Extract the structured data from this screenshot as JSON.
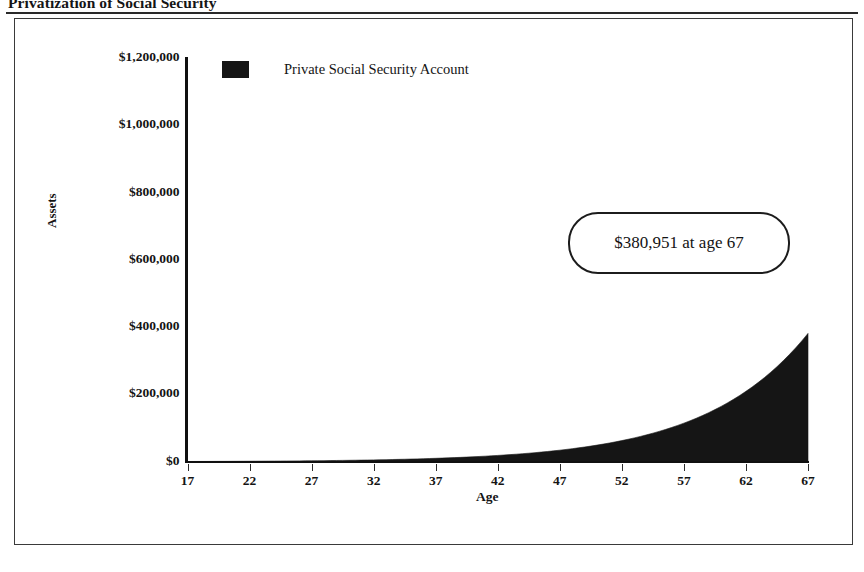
{
  "document": {
    "title": "Privatization of Social Security"
  },
  "chart_data": {
    "type": "area",
    "title": "Privatization of Social Security",
    "xlabel": "Age",
    "ylabel": "Assets",
    "grid": false,
    "legend_position": "top-left-inside",
    "xlim": [
      17,
      67
    ],
    "ylim": [
      0,
      1200000
    ],
    "x_tick_labels": [
      "17",
      "22",
      "27",
      "32",
      "37",
      "42",
      "47",
      "52",
      "57",
      "62",
      "67"
    ],
    "y_tick_labels": [
      "$0",
      "$200,000",
      "$400,000",
      "$600,000",
      "$800,000",
      "$1,000,000",
      "$1,200,000"
    ],
    "y_tick_values": [
      0,
      200000,
      400000,
      600000,
      800000,
      1000000,
      1200000
    ],
    "series": [
      {
        "name": "Private Social Security Account",
        "color": "#151515",
        "x": [
          17,
          22,
          27,
          32,
          37,
          42,
          47,
          52,
          57,
          62,
          67
        ],
        "values": [
          0,
          8200,
          20500,
          38500,
          65000,
          103500,
          159500,
          241000,
          360000,
          533000,
          380951
        ]
      }
    ],
    "annotations": [
      {
        "text": "$380,951 at age 67",
        "value": 380951,
        "at_x": 67
      }
    ],
    "final_value": 380951,
    "final_age": 67
  },
  "legend": {
    "entries": [
      {
        "label": "Private Social Security Account",
        "color": "#151515"
      }
    ]
  },
  "annotation": {
    "text": "$380,951 at age 67"
  },
  "axes": {
    "y_title": "Assets",
    "x_title": "Age"
  }
}
